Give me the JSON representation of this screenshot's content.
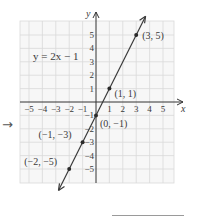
{
  "chart_data": {
    "type": "line",
    "title": "",
    "equation_label": "y = 2x − 1",
    "xlabel": "x",
    "ylabel": "y",
    "xlim": [
      -5.8,
      6
    ],
    "ylim": [
      -6,
      6.2
    ],
    "grid": true,
    "x_ticks": [
      -5,
      -4,
      -3,
      -2,
      -1,
      1,
      2,
      3,
      4,
      5
    ],
    "x_tick_labels": [
      "−5",
      "−4",
      "−3",
      "−2",
      "−1",
      "1",
      "2",
      "3",
      "4",
      "5"
    ],
    "y_ticks": [
      -5,
      -4,
      -3,
      -2,
      -1,
      1,
      2,
      3,
      4,
      5
    ],
    "y_tick_labels": [
      "−5",
      "−4",
      "−3",
      "−2",
      "−1",
      "1",
      "2",
      "3",
      "4",
      "5"
    ],
    "series": [
      {
        "name": "y = 2x − 1",
        "slope": 2,
        "intercept": -1,
        "x": [
          -2,
          -1,
          0,
          1,
          3
        ],
        "y": [
          -5,
          -3,
          -1,
          1,
          5
        ]
      }
    ],
    "annotations": [
      {
        "x": 3,
        "y": 5,
        "text": "(3, 5)"
      },
      {
        "x": 1,
        "y": 1,
        "text": "(1, 1)"
      },
      {
        "x": 0,
        "y": -1,
        "text": "(0, −1)"
      },
      {
        "x": -1,
        "y": -3,
        "text": "(−1, −3)"
      },
      {
        "x": -2,
        "y": -5,
        "text": "(−2, −5)"
      }
    ]
  },
  "side_arrow": "→",
  "colors": {
    "grid": "#d9d9d9",
    "axis": "#333333",
    "line": "#3a3a3a",
    "point": "#2a2a2a",
    "text": "#3a3a3a"
  }
}
